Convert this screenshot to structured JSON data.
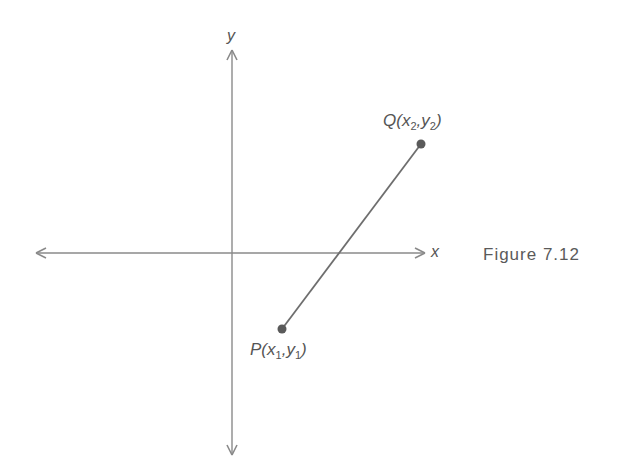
{
  "figure": {
    "caption": "Figure 7.12",
    "axes": {
      "x_label": "x",
      "y_label": "y",
      "origin_px": [
        232,
        253
      ]
    },
    "points": {
      "P": {
        "name": "P",
        "x_var": "x",
        "x_sub": "1",
        "y_var": "y",
        "y_sub": "1",
        "label": "P(x1,y1)",
        "px": [
          282,
          329
        ]
      },
      "Q": {
        "name": "Q",
        "x_var": "x",
        "x_sub": "2",
        "y_var": "y",
        "y_sub": "2",
        "label": "Q(x2,y2)",
        "px": [
          421,
          144
        ]
      }
    },
    "segment": "PQ",
    "colors": {
      "axis": "#8a8a8a",
      "segment": "#6e6e6e",
      "point": "#5a5a5a",
      "text": "#555555"
    }
  }
}
